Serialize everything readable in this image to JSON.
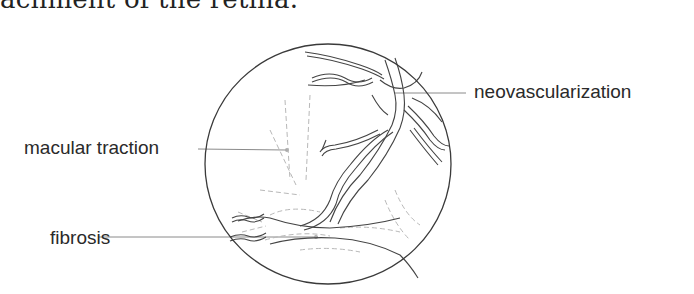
{
  "caption": {
    "text": "achment of the retina."
  },
  "diagram": {
    "labels": {
      "macular_traction": "macular traction",
      "fibrosis": "fibrosis",
      "neovascularization": "neovascularization"
    },
    "colors": {
      "outline": "#3a3a3a",
      "vessel": "#444444",
      "leader": "#8a8a8a",
      "fibrosis_strokes": "#b5b5b5",
      "text": "#2a2a2a"
    }
  }
}
